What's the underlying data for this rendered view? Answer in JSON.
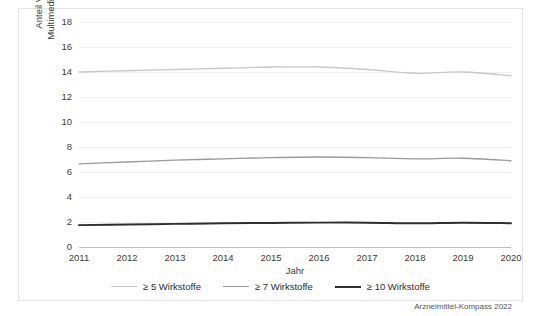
{
  "chart_data": {
    "type": "line",
    "title": "",
    "xlabel": "Jahr",
    "ylabel": "Anteil Versicherte mit Multimedikation in Prozent",
    "ylabel_line1": "Anteil Versicherte mit",
    "ylabel_line2": "Multimedikation in Prozent",
    "categories": [
      "2011",
      "2012",
      "2013",
      "2014",
      "2015",
      "2016",
      "2017",
      "2018",
      "2019",
      "2020"
    ],
    "x": [
      2011,
      2012,
      2013,
      2014,
      2015,
      2016,
      2017,
      2018,
      2019,
      2020
    ],
    "yticks": [
      0,
      2,
      4,
      6,
      8,
      10,
      12,
      14,
      16,
      18
    ],
    "ytick_labels": [
      "0",
      "2",
      "4",
      "6",
      "8",
      "10",
      "12",
      "14",
      "16",
      "18"
    ],
    "ylim": [
      0,
      18
    ],
    "xlim": [
      2011,
      2020
    ],
    "grid": true,
    "legend_position": "bottom",
    "series": [
      {
        "name": "≥ 5 Wirkstoffe",
        "color": "#c8c8c8",
        "width": 1.3,
        "values": [
          14.0,
          14.1,
          14.2,
          14.3,
          14.4,
          14.4,
          14.2,
          13.9,
          14.0,
          13.7
        ]
      },
      {
        "name": "≥ 7 Wirkstoffe",
        "color": "#9a9a9a",
        "width": 1.3,
        "values": [
          6.65,
          6.8,
          6.95,
          7.05,
          7.15,
          7.2,
          7.15,
          7.05,
          7.1,
          6.9
        ]
      },
      {
        "name": "≥ 10 Wirkstoffe",
        "color": "#2e2e2e",
        "width": 2.0,
        "values": [
          1.75,
          1.8,
          1.85,
          1.9,
          1.92,
          1.95,
          1.95,
          1.9,
          1.95,
          1.9
        ]
      }
    ]
  },
  "legend": {
    "items": [
      {
        "label": "≥ 5 Wirkstoffe",
        "color": "#c8c8c8",
        "width": 1.3
      },
      {
        "label": "≥ 7 Wirkstoffe",
        "color": "#9a9a9a",
        "width": 1.3
      },
      {
        "label": "≥ 10 Wirkstoffe",
        "color": "#2e2e2e",
        "width": 2.0
      }
    ]
  },
  "source": {
    "credit": "Arzneimittel-Kompass 2022"
  },
  "colors": {
    "frame": "#e3e3e3",
    "grid": "#f0f0f0",
    "axis": "#bdbdbd",
    "text": "#3a3a3a",
    "background": "#ffffff"
  }
}
